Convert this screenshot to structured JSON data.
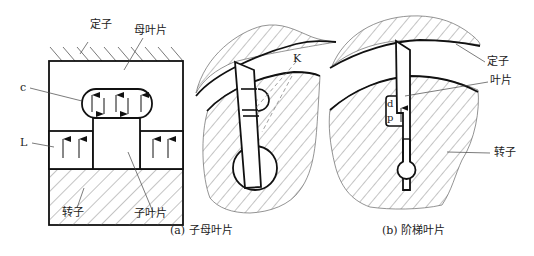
{
  "figure_a": {
    "caption": "(a) 子母叶片",
    "labels": {
      "stator": "定子",
      "mother_vane": "母叶片",
      "chamber_c": "c",
      "chamber_l": "L",
      "rotor": "转子",
      "child_vane": "子叶片"
    }
  },
  "figure_mid": {
    "labels": {
      "k": "K"
    }
  },
  "figure_b": {
    "caption": "(b) 阶梯叶片",
    "labels": {
      "stator": "定子",
      "vane": "叶片",
      "rotor": "转子",
      "d": "d",
      "p": "p"
    }
  },
  "colors": {
    "line": "#111111",
    "hatch": "#555555",
    "background": "#ffffff"
  }
}
